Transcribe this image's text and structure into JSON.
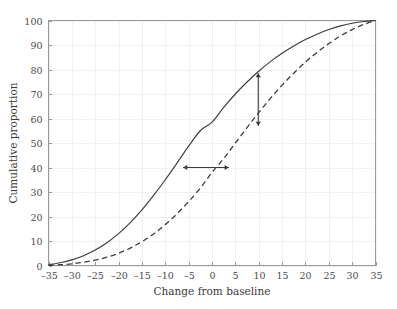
{
  "chart_data": {
    "type": "line",
    "title": "",
    "xlabel": "Change from baseline",
    "ylabel": "Cumulative proportion",
    "xlim": [
      -35,
      35
    ],
    "ylim": [
      0,
      100
    ],
    "grid": true,
    "legend": "none",
    "xticks": [
      -35,
      -30,
      -25,
      -20,
      -15,
      -10,
      -5,
      0,
      5,
      10,
      15,
      20,
      25,
      30,
      35
    ],
    "xtick_labels": [
      "–35",
      "–30",
      "–25",
      "–20",
      "–15",
      "–10",
      "–5",
      "0",
      "5",
      "10",
      "15",
      "20",
      "25",
      "30",
      "35"
    ],
    "yticks": [
      0,
      10,
      20,
      30,
      40,
      50,
      60,
      70,
      80,
      90,
      100
    ],
    "ytick_labels": [
      "0",
      "10",
      "20",
      "30",
      "40",
      "50",
      "60",
      "70",
      "80",
      "90",
      "100"
    ],
    "x": [
      -35,
      -32.5,
      -30,
      -27.5,
      -25,
      -22.5,
      -20,
      -17.5,
      -15,
      -12.5,
      -10,
      -7.5,
      -5,
      -2.5,
      0,
      2.5,
      5,
      7.5,
      10,
      12.5,
      15,
      17.5,
      20,
      22.5,
      25,
      27.5,
      30,
      32.5,
      35
    ],
    "series": [
      {
        "name": "Treatment",
        "style": "solid",
        "color": "#3c3c3c",
        "values": [
          0.3,
          1.1,
          2.3,
          4.0,
          6.3,
          9.3,
          13.0,
          17.5,
          22.7,
          28.6,
          35.0,
          41.8,
          48.7,
          55.0,
          58.5,
          64.5,
          70.0,
          74.9,
          79.3,
          83.2,
          86.6,
          89.6,
          92.2,
          94.4,
          96.3,
          97.8,
          98.9,
          99.6,
          100.0
        ]
      },
      {
        "name": "Control",
        "style": "dashed",
        "color": "#3c3c3c",
        "values": [
          0.1,
          0.3,
          0.7,
          1.3,
          2.2,
          3.4,
          5.0,
          7.1,
          9.7,
          12.9,
          16.7,
          21.1,
          26.1,
          31.6,
          38.0,
          43.6,
          50.0,
          56.3,
          62.4,
          68.2,
          73.6,
          78.5,
          83.0,
          87.0,
          90.6,
          93.7,
          96.3,
          98.4,
          100.0
        ]
      }
    ],
    "annotations": [
      {
        "name": "horizontal-shift-arrow",
        "type": "double-arrow",
        "orientation": "horizontal",
        "y": 40,
        "x_start": -6.2,
        "x_end": 3.6
      },
      {
        "name": "vertical-shift-arrow",
        "type": "double-arrow",
        "orientation": "vertical",
        "x": 9.9,
        "y_start": 78.5,
        "y_end": 57.0
      }
    ]
  }
}
